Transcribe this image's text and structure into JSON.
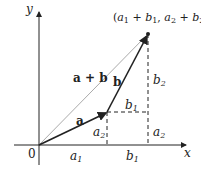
{
  "diagram": {
    "axes": {
      "x_label": "x",
      "y_label": "y",
      "origin_label": "0"
    },
    "vectors": [
      {
        "name": "a",
        "label": "a"
      },
      {
        "name": "b",
        "label": "b"
      },
      {
        "name": "a+b",
        "label": "a + b"
      }
    ],
    "point_label": {
      "open": "(",
      "a": "a",
      "s1": "1",
      "plus1": " + ",
      "b": "b",
      "s1b": "1",
      "comma": ", ",
      "a2": "a",
      "s2": "2",
      "plus2": " + ",
      "b2": "b",
      "s2b": "2",
      "close": ")"
    },
    "components": {
      "a1": {
        "base": "a",
        "sub": "1"
      },
      "b1_bottom": {
        "base": "b",
        "sub": "1"
      },
      "a2_left": {
        "base": "a",
        "sub": "2"
      },
      "a2_right": {
        "base": "a",
        "sub": "2"
      },
      "b1_mid": {
        "base": "b",
        "sub": "1"
      },
      "b2": {
        "base": "b",
        "sub": "2"
      }
    },
    "colors": {
      "axis": "#222222",
      "vector": "#222222",
      "sum": "#aaaaaa",
      "dashed": "#222222"
    }
  }
}
